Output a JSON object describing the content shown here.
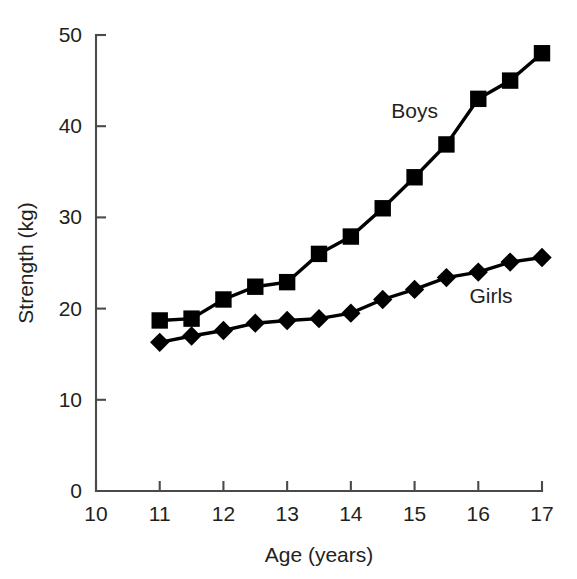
{
  "chart_data": {
    "type": "line",
    "title": "",
    "xlabel": "Age (years)",
    "ylabel": "Strength (kg)",
    "xlim": [
      10,
      17
    ],
    "ylim": [
      0,
      50
    ],
    "xticks": [
      10,
      11,
      12,
      13,
      14,
      15,
      16,
      17
    ],
    "xticklabels": [
      "10",
      "11",
      "12",
      "13",
      "14",
      "15",
      "16",
      "17"
    ],
    "yticks": [
      0,
      10,
      20,
      30,
      40,
      50
    ],
    "yticklabels": [
      "0",
      "10",
      "20",
      "30",
      "40",
      "50"
    ],
    "grid": false,
    "legend_position": "inline-annotation",
    "x": [
      11,
      11.5,
      12,
      12.5,
      13,
      13.5,
      14,
      14.5,
      15,
      15.5,
      16,
      16.5,
      17
    ],
    "series": [
      {
        "name": "Boys",
        "marker": "square",
        "color": "#000000",
        "label_x": 15.0,
        "label_y": 40.9,
        "values": [
          18.7,
          18.9,
          21.0,
          22.4,
          22.9,
          26.0,
          27.9,
          31.0,
          34.4,
          38.0,
          43.0,
          45.0,
          48.0
        ]
      },
      {
        "name": "Girls",
        "marker": "diamond",
        "color": "#000000",
        "label_x": 16.2,
        "label_y": 20.6,
        "values": [
          16.3,
          17.0,
          17.6,
          18.4,
          18.7,
          18.9,
          19.5,
          21.0,
          22.1,
          23.4,
          24.0,
          25.1,
          25.6
        ]
      }
    ]
  },
  "axes": {
    "x_title": "Age (years)",
    "y_title": "Strength (kg)"
  }
}
